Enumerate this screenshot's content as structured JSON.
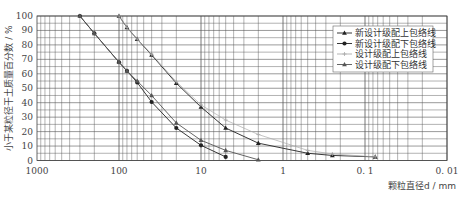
{
  "chart_data": {
    "type": "line",
    "title": "",
    "xlabel": "颗粒直径d / mm",
    "ylabel": "小于某粒径干土质量百分数 / %",
    "x_scale": "log",
    "x_reversed": true,
    "xlim": [
      1000,
      0.01
    ],
    "ylim": [
      0,
      100
    ],
    "x_ticks": [
      "1000",
      "100",
      "10",
      "1",
      "0. 1",
      "0. 01"
    ],
    "y_ticks": [
      "0",
      "10",
      "20",
      "30",
      "40",
      "50",
      "60",
      "70",
      "80",
      "90",
      "100"
    ],
    "grid": true,
    "legend_position": "upper right",
    "series": [
      {
        "name": "新设计级配上包络线",
        "marker": "triangle",
        "color": "#222222",
        "x": [
          100,
          80,
          60,
          40,
          20,
          10,
          5,
          2,
          0.5,
          0.25,
          0.075
        ],
        "y": [
          100,
          92,
          84,
          73,
          53.5,
          37,
          22.5,
          12,
          5,
          3.5,
          2.5
        ]
      },
      {
        "name": "新设计级配下包络线",
        "marker": "circle",
        "color": "#222222",
        "x": [
          300,
          200,
          100,
          80,
          60,
          40,
          20,
          10,
          5
        ],
        "y": [
          100,
          88,
          68,
          62,
          54,
          40.5,
          22.5,
          10.5,
          2.5
        ]
      },
      {
        "name": "设计级配上包络线",
        "marker": "cross",
        "color": "#aaaaaa",
        "x": [
          100,
          80,
          60,
          40,
          20,
          10,
          5,
          2,
          0.5,
          0.25,
          0.075
        ],
        "y": [
          100,
          92,
          84,
          73.5,
          54.5,
          38.5,
          28,
          18,
          7,
          4.5,
          2.5
        ]
      },
      {
        "name": "设计级配下包络线",
        "marker": "triangle",
        "color": "#555555",
        "x": [
          300,
          200,
          100,
          80,
          60,
          40,
          20,
          10,
          5,
          2
        ],
        "y": [
          100,
          88,
          68,
          62,
          55,
          45,
          26,
          14,
          7,
          0.5
        ]
      }
    ]
  },
  "legend": {
    "items": [
      "新设计级配上包络线",
      "新设计级配下包络线",
      "设计级配上包络线",
      "设计级配下包络线"
    ]
  },
  "axes": {
    "xlabel": "颗粒直径d / mm",
    "ylabel": "小于某粒径干土质量百分数 / %"
  }
}
